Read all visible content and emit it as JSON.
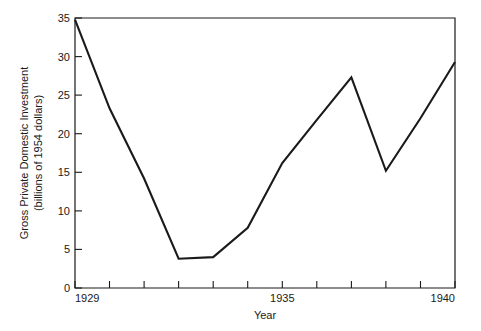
{
  "chart_data": {
    "type": "line",
    "title": "",
    "xlabel": "Year",
    "ylabel": "Gross Private Domestic Investment\n(billions of 1954 dollars)",
    "ylabel_line1": "Gross Private Domestic Investment",
    "ylabel_line2": "(billions of 1954 dollars)",
    "x": [
      1929,
      1930,
      1931,
      1932,
      1933,
      1934,
      1935,
      1936,
      1937,
      1938,
      1939,
      1940
    ],
    "values": [
      34.8,
      23.3,
      14.2,
      3.8,
      4.0,
      7.8,
      16.2,
      21.8,
      27.3,
      15.2,
      22.0,
      29.3
    ],
    "xlim": [
      1929,
      1940
    ],
    "ylim": [
      0,
      35
    ],
    "xticks": [
      1929,
      1930,
      1931,
      1932,
      1933,
      1934,
      1935,
      1936,
      1937,
      1938,
      1939,
      1940
    ],
    "xtick_labels": [
      "1929",
      "",
      "",
      "",
      "",
      "",
      "1935",
      "",
      "",
      "",
      "",
      "1940"
    ],
    "yticks": [
      0,
      5,
      10,
      15,
      20,
      25,
      30,
      35
    ],
    "ytick_labels": [
      "0",
      "5",
      "10",
      "15",
      "20",
      "25",
      "30",
      "35"
    ],
    "grid": false,
    "legend": false,
    "legend_position": "none",
    "line_color": "#1a1a1a",
    "background_color": "#ffffff"
  },
  "axes": {
    "x_title": "Year",
    "y_title_line1": "Gross Private Domestic Investment",
    "y_title_line2": "(billions of 1954 dollars)"
  },
  "y_labels": {
    "t0": "0",
    "t5": "5",
    "t10": "10",
    "t15": "15",
    "t20": "20",
    "t25": "25",
    "t30": "30",
    "t35": "35"
  },
  "x_labels": {
    "start": "1929",
    "middle": "1935",
    "end": "1940"
  }
}
